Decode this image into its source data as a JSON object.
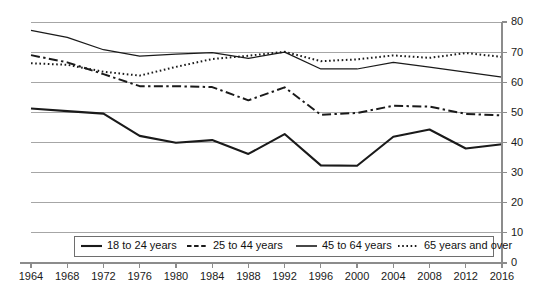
{
  "chart_data": {
    "type": "line",
    "title": "",
    "subtitle": "",
    "xlabel": "",
    "ylabel": "",
    "grid": true,
    "legend_position": "bottom",
    "y_axis_side": "right",
    "xlim": [
      1964,
      2016
    ],
    "ylim": [
      0,
      80
    ],
    "y_ticks": [
      0,
      10,
      20,
      30,
      40,
      50,
      60,
      70,
      80
    ],
    "x_ticks": [
      1964,
      1968,
      1972,
      1976,
      1980,
      1984,
      1988,
      1992,
      1996,
      2000,
      2004,
      2008,
      2012,
      2016
    ],
    "x": [
      1964,
      1968,
      1972,
      1976,
      1980,
      1984,
      1988,
      1992,
      1996,
      2000,
      2004,
      2008,
      2012,
      2016
    ],
    "series": [
      {
        "name": "18 to 24 years",
        "style": "solid-thick",
        "values": [
          51.3,
          50.4,
          49.6,
          42.2,
          39.9,
          40.8,
          36.2,
          42.8,
          32.4,
          32.3,
          41.9,
          44.3,
          38.0,
          39.4
        ]
      },
      {
        "name": "25 to 44 years",
        "style": "dash-dot",
        "values": [
          69.0,
          66.6,
          62.7,
          58.7,
          58.7,
          58.4,
          54.0,
          58.3,
          49.2,
          49.8,
          52.2,
          51.9,
          49.5,
          49.0
        ]
      },
      {
        "name": "45 to 64 years",
        "style": "solid-thin",
        "values": [
          77.2,
          74.9,
          70.8,
          68.7,
          69.3,
          69.8,
          67.9,
          70.0,
          64.4,
          64.4,
          66.6,
          65.0,
          63.4,
          61.7
        ]
      },
      {
        "name": "65 years and over",
        "style": "dotted",
        "values": [
          66.3,
          65.8,
          63.5,
          62.2,
          65.1,
          67.7,
          68.8,
          70.1,
          67.0,
          67.6,
          68.9,
          68.1,
          69.7,
          68.4
        ]
      }
    ]
  },
  "legend": {
    "items": [
      {
        "label": "18 to 24 years",
        "style": "solid-thick"
      },
      {
        "label": "25 to 44 years",
        "style": "dash-dot"
      },
      {
        "label": "45 to 64 years",
        "style": "solid-thin"
      },
      {
        "label": "65 years and over",
        "style": "dotted"
      }
    ]
  },
  "axis": {
    "y_tick_labels": [
      "0",
      "10",
      "20",
      "30",
      "40",
      "50",
      "60",
      "70",
      "80"
    ],
    "x_tick_labels": [
      "1964",
      "1968",
      "1972",
      "1976",
      "1980",
      "1984",
      "1988",
      "1992",
      "1996",
      "2000",
      "2004",
      "2008",
      "2012",
      "2016"
    ]
  }
}
